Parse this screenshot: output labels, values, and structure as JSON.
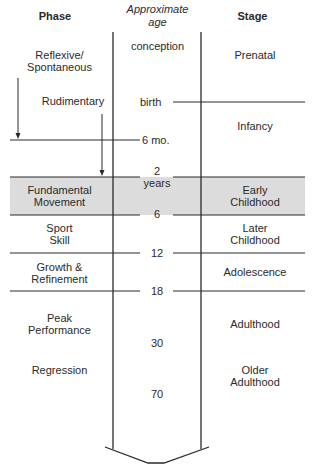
{
  "headers": {
    "phase": "Phase",
    "age_line1": "Approximate",
    "age_line2": "age",
    "stage": "Stage"
  },
  "colors": {
    "line": "#2a2a2a",
    "highlight_band": "#dcdcdc",
    "text": "#2a2a2a"
  },
  "phases": [
    {
      "line1": "Reflexive/",
      "line2": "Spontaneous"
    },
    {
      "line1": "Rudimentary",
      "line2": ""
    },
    {
      "line1": "Fundamental",
      "line2": "Movement"
    },
    {
      "line1": "Sport",
      "line2": "Skill"
    },
    {
      "line1": "Growth &",
      "line2": "Refinement"
    },
    {
      "line1": "Peak",
      "line2": "Performance"
    },
    {
      "line1": "Regression",
      "line2": ""
    }
  ],
  "ages": [
    {
      "line1": "conception",
      "line2": ""
    },
    {
      "line1": "birth",
      "line2": ""
    },
    {
      "line1": "6 mo.",
      "line2": ""
    },
    {
      "line1": "2",
      "line2": "years"
    },
    {
      "line1": "6",
      "line2": ""
    },
    {
      "line1": "12",
      "line2": ""
    },
    {
      "line1": "18",
      "line2": ""
    },
    {
      "line1": "30",
      "line2": ""
    },
    {
      "line1": "70",
      "line2": ""
    }
  ],
  "stages": [
    {
      "line1": "Prenatal",
      "line2": ""
    },
    {
      "line1": "Infancy",
      "line2": ""
    },
    {
      "line1": "Early",
      "line2": "Childhood"
    },
    {
      "line1": "Later",
      "line2": "Childhood"
    },
    {
      "line1": "Adolescence",
      "line2": ""
    },
    {
      "line1": "Adulthood",
      "line2": ""
    },
    {
      "line1": "Older",
      "line2": "Adulthood"
    }
  ],
  "highlighted_row": {
    "phase": "Fundamental Movement",
    "stage": "Early Childhood",
    "age_range": "2 years - 6"
  }
}
